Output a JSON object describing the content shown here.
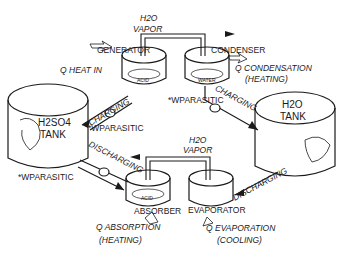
{
  "components": {
    "generator": "GENERATOR",
    "condenser": "CONDENSER",
    "absorber": "ABSORBER",
    "evaporator": "EVAPORATOR",
    "acid_tag_top": "ACID",
    "acid_tag_bottom": "ACID",
    "water_tag": "WATER"
  },
  "tanks": {
    "h2so4": {
      "line1": "H2SO4",
      "line2": "TANK"
    },
    "h2o": {
      "line1": "H2O",
      "line2": "TANK"
    }
  },
  "flows": {
    "vapor_top": {
      "formula": "H2O",
      "label": "VAPOR"
    },
    "vapor_bottom": {
      "formula": "H2O",
      "label": "VAPOR"
    },
    "charging_left": "CHARGING",
    "charging_right": "CHARGING",
    "discharging_left": "DISCHARGING",
    "discharging_right": "DISCHARGING"
  },
  "heat": {
    "heat_in": {
      "symbol": "Q",
      "label": "HEAT IN"
    },
    "condensation": {
      "symbol": "Q",
      "label": "CONDENSATION",
      "note": "(HEATING)"
    },
    "absorption": {
      "symbol": "Q",
      "label": "ABSORPTION",
      "note": "(HEATING)"
    },
    "evaporation": {
      "symbol": "Q",
      "label": "EVAPORATION",
      "note": "(COOLING)"
    }
  },
  "parasitic": {
    "left_top": {
      "prefix": "*W",
      "label": "PARASITIC"
    },
    "left_bottom": {
      "prefix": "*W",
      "label": "PARASITIC"
    },
    "right": {
      "prefix": "*W",
      "label": "PARASITIC"
    }
  }
}
